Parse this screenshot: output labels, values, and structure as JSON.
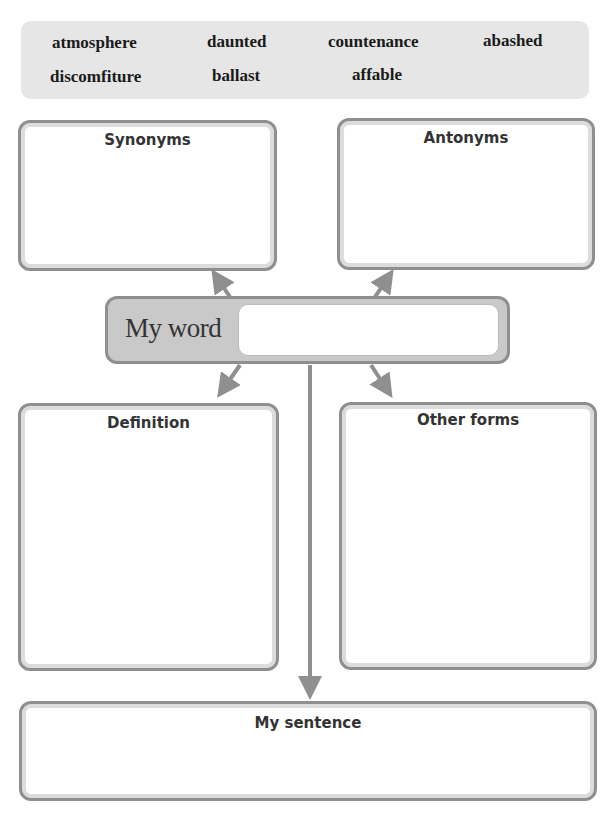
{
  "word_bank": {
    "words": [
      "atmosphere",
      "daunted",
      "countenance",
      "abashed",
      "discomfiture",
      "ballast",
      "affable"
    ]
  },
  "organizer": {
    "center": {
      "label": "My word",
      "value": ""
    },
    "synonyms": {
      "title": "Synonyms",
      "value": ""
    },
    "antonyms": {
      "title": "Antonyms",
      "value": ""
    },
    "definition": {
      "title": "Definition",
      "value": ""
    },
    "other_forms": {
      "title": "Other forms",
      "value": ""
    },
    "sentence": {
      "title": "My sentence",
      "value": ""
    }
  },
  "colors": {
    "border": "#8f8f8f",
    "inner_border": "#dcdcdc",
    "word_bank_bg": "#e6e6e6",
    "center_bg": "#c9c9c9",
    "text": "#333333"
  }
}
